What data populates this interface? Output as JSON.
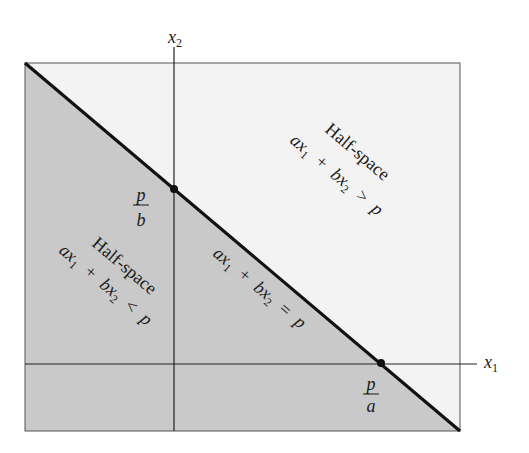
{
  "diagram": {
    "axes": {
      "x_label": "x",
      "x_sub": "1",
      "y_label": "x",
      "y_sub": "2"
    },
    "line": {
      "eq_a": "ax",
      "eq_sub1": "1",
      "eq_plus": "+",
      "eq_b": "bx",
      "eq_sub2": "2",
      "eq_rel": "=",
      "eq_p": "p"
    },
    "intercepts": {
      "y_intercept_num": "p",
      "y_intercept_den": "b",
      "x_intercept_num": "p",
      "x_intercept_den": "a"
    },
    "upper_region": {
      "title": "Half-space",
      "eq_a": "ax",
      "eq_sub1": "1",
      "eq_plus": "+",
      "eq_b": "bx",
      "eq_sub2": "2",
      "eq_rel": ">",
      "eq_p": "p"
    },
    "lower_region": {
      "title": "Half-space",
      "eq_a": "ax",
      "eq_sub1": "1",
      "eq_plus": "+",
      "eq_b": "bx",
      "eq_sub2": "2",
      "eq_rel": "<",
      "eq_p": "p"
    },
    "colors": {
      "shaded": "#c9c9c9",
      "unshaded": "#f3f3f3",
      "line": "#111111",
      "frame": "#555555"
    }
  }
}
